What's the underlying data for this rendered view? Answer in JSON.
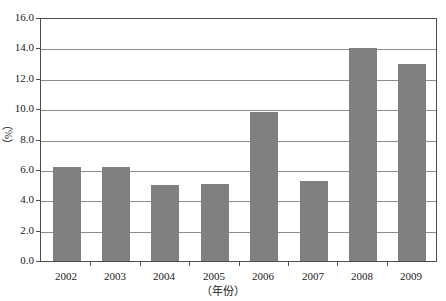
{
  "chart_data": {
    "type": "bar",
    "title": "",
    "xlabel": "（年份）",
    "ylabel": "（%）",
    "categories": [
      "2002",
      "2003",
      "2004",
      "2005",
      "2006",
      "2007",
      "2008",
      "2009"
    ],
    "values": [
      6.2,
      6.2,
      5.0,
      5.1,
      9.8,
      5.3,
      14.0,
      13.0
    ],
    "ylim": [
      0.0,
      16.0
    ],
    "ytick_labels": [
      "0.0",
      "2.0",
      "4.0",
      "6.0",
      "8.0",
      "10.0",
      "12.0",
      "14.0",
      "16.0"
    ],
    "ytick_values": [
      0.0,
      2.0,
      4.0,
      6.0,
      8.0,
      10.0,
      12.0,
      14.0,
      16.0
    ],
    "ystep": 2.0,
    "grid": true,
    "legend": false,
    "legend_position": "none",
    "bar_color": "#808080",
    "gridline_color": "#8c8c8c",
    "axis_color": "#4d4d4d",
    "background_color": "#ffffff"
  }
}
